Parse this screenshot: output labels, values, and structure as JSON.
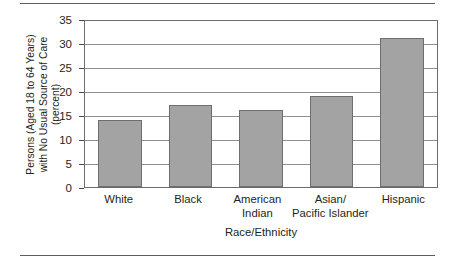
{
  "chart_data": {
    "type": "bar",
    "title": "",
    "xlabel": "Race/Ethnicity",
    "ylabel_lines": [
      "Persons (Aged 18 to 64 Years)",
      "with No Usual Source of Care",
      "(percent)"
    ],
    "categories": [
      "White",
      "Black",
      "American Indian",
      "Asian/Pacific Islander",
      "Hispanic"
    ],
    "category_label_lines": [
      [
        "White"
      ],
      [
        "Black"
      ],
      [
        "American",
        "Indian"
      ],
      [
        "Asian/",
        "Pacific Islander"
      ],
      [
        "Hispanic"
      ]
    ],
    "values": [
      14,
      17,
      16,
      19,
      31
    ],
    "ylim": [
      0,
      35
    ],
    "yticks": [
      0,
      5,
      10,
      15,
      20,
      25,
      30,
      35
    ],
    "ytick_labels": [
      "0",
      "5",
      "10",
      "15",
      "20",
      "25",
      "30",
      "35"
    ],
    "grid": true,
    "grid_axis": "y",
    "legend": false,
    "legend_position": "none",
    "bar_fill_color": "#a3a3a3",
    "bar_border_color": "#6e6e6e",
    "gridline_color": "#8e8e8e",
    "frame_color": "#6b6b6b",
    "text_color": "#231f20",
    "rule_color": "#5d5d5d"
  }
}
